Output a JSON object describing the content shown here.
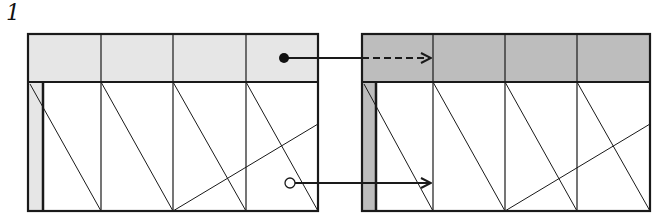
{
  "figure": {
    "label": "1"
  },
  "colors": {
    "line": "#1a1a1a",
    "left_header_fill": "#e6e6e6",
    "right_header_fill": "#bdbdbd",
    "background": "#ffffff"
  },
  "panels": [
    {
      "name": "before",
      "header_shade": "light",
      "columns": 4
    },
    {
      "name": "after",
      "header_shade": "dark",
      "columns": 4
    }
  ],
  "connectors": [
    {
      "from": "filled-dot-in-header-col-4",
      "to": "header-col-1-of-right-panel",
      "style": "solid-then-dashed"
    },
    {
      "from": "open-dot-in-body-col-4",
      "to": "body-col-1-of-right-panel",
      "style": "solid"
    }
  ]
}
